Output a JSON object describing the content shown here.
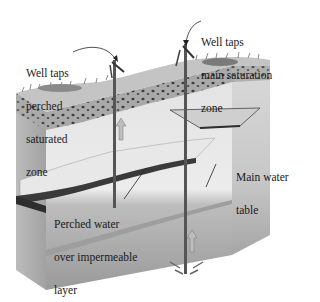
{
  "diagram": {
    "labels": {
      "perched_well": [
        "Well taps",
        "perched",
        "saturated",
        "zone"
      ],
      "main_well": [
        "Well taps",
        "main saturation",
        "zone"
      ],
      "perched_water": [
        "Perched water",
        "over impermeable",
        "layer"
      ],
      "main_water_table": [
        "Main water",
        "table"
      ]
    },
    "components": [
      {
        "id": "ground-surface",
        "desc": "vegetated soil surface"
      },
      {
        "id": "soil-layer",
        "desc": "dark pebbly soil zone"
      },
      {
        "id": "unsaturated-zone",
        "desc": "light unsaturated rock"
      },
      {
        "id": "impermeable-layer",
        "desc": "lens of impermeable material"
      },
      {
        "id": "perched-water",
        "desc": "water perched above impermeable layer"
      },
      {
        "id": "main-saturation-zone",
        "desc": "darker saturated zone below water table"
      },
      {
        "id": "well-left",
        "desc": "shallow hand pump well into perched zone"
      },
      {
        "id": "well-right",
        "desc": "deep hand pump well into main saturation zone"
      }
    ],
    "colors": {
      "surface": "#c9c9c9",
      "soil": "#8a8a8a",
      "unsaturated": "#e6e6e6",
      "saturated": "#a9a9a9",
      "impermeable": "#3a3a3a",
      "text": "#1a1a1a"
    }
  }
}
